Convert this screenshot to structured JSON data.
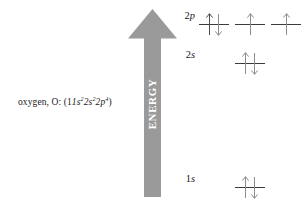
{
  "diagram": {
    "title_label": "oxygen, O:",
    "element_name": "oxygen",
    "element_symbol": "O",
    "configuration_open": "(1",
    "configuration_close": ")",
    "energy_axis_label": "ENERGY",
    "arrow_color": "#9a9a9a",
    "line_color": "#3b3b3b",
    "arrow_glyph_color": "#4a4a4a",
    "background_color": "#ffffff",
    "configuration_terms": [
      {
        "n": "1",
        "orbital": "s",
        "electrons": "2"
      },
      {
        "n": "2",
        "orbital": "s",
        "electrons": "2"
      },
      {
        "n": "2",
        "orbital": "p",
        "electrons": "4"
      }
    ],
    "levels": [
      {
        "id": "2p",
        "n": "2",
        "orbital": "p",
        "label_n": "2",
        "label_orbital": "p",
        "slots": [
          {
            "spins": [
              "up",
              "down"
            ]
          },
          {
            "spins": [
              "up"
            ]
          },
          {
            "spins": [
              "up"
            ]
          }
        ]
      },
      {
        "id": "2s",
        "n": "2",
        "orbital": "s",
        "label_n": "2",
        "label_orbital": "s",
        "slots": [
          {
            "spins": []
          },
          {
            "spins": [
              "up",
              "down"
            ]
          },
          {
            "spins": []
          }
        ]
      },
      {
        "id": "1s",
        "n": "1",
        "orbital": "s",
        "label_n": "1",
        "label_orbital": "s",
        "slots": [
          {
            "spins": []
          },
          {
            "spins": [
              "up",
              "down"
            ]
          },
          {
            "spins": []
          }
        ]
      }
    ]
  }
}
